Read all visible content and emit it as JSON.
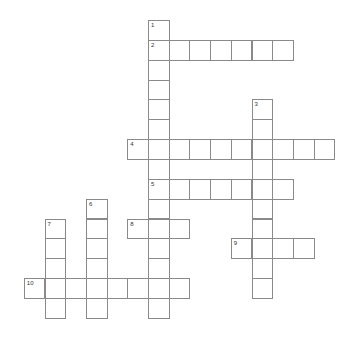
{
  "puzzle": {
    "type": "crossword",
    "grid": {
      "origin_x": 148,
      "origin_y": 20,
      "cell_w": 20.7,
      "cell_h": 19.85
    },
    "colors": {
      "border": "#8a8a8a",
      "background": "#ffffff",
      "number": "#333333"
    },
    "words": [
      {
        "number": "1",
        "direction": "down",
        "col": 0,
        "row": 0,
        "length": 15
      },
      {
        "number": "2",
        "direction": "across",
        "col": 0,
        "row": 1,
        "length": 7
      },
      {
        "number": "3",
        "direction": "down",
        "col": 5,
        "row": 4,
        "length": 10
      },
      {
        "number": "4",
        "direction": "across",
        "col": -1,
        "row": 6,
        "length": 10
      },
      {
        "number": "5",
        "direction": "across",
        "col": 0,
        "row": 8,
        "length": 7
      },
      {
        "number": "6",
        "direction": "down",
        "col": -3,
        "row": 9,
        "length": 6
      },
      {
        "number": "7",
        "direction": "down",
        "col": -5,
        "row": 10,
        "length": 5
      },
      {
        "number": "8",
        "direction": "across",
        "col": -1,
        "row": 10,
        "length": 3
      },
      {
        "number": "9",
        "direction": "across",
        "col": 4,
        "row": 11,
        "length": 4
      },
      {
        "number": "10",
        "direction": "across",
        "col": -6,
        "row": 13,
        "length": 8
      }
    ]
  }
}
